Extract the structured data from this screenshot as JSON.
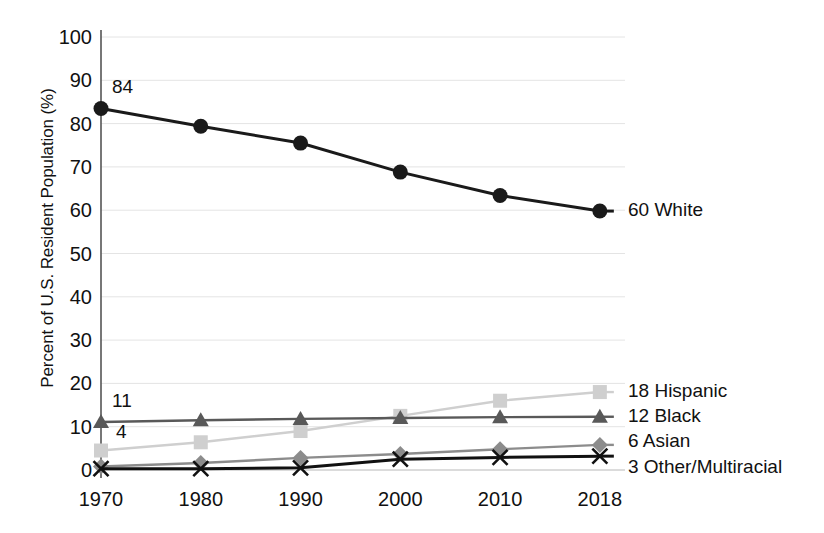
{
  "chart_data": {
    "type": "line",
    "title": "",
    "xlabel": "",
    "ylabel": "Percent of U.S. Resident Population (%)",
    "categories": [
      "1970",
      "1980",
      "1990",
      "2000",
      "2010",
      "2018"
    ],
    "ylim": [
      0,
      100
    ],
    "ytick_labels": [
      "0",
      "10",
      "20",
      "30",
      "40",
      "50",
      "60",
      "70",
      "80",
      "90",
      "100"
    ],
    "ytick_values": [
      0,
      10,
      20,
      30,
      40,
      50,
      60,
      70,
      80,
      90,
      100
    ],
    "grid": true,
    "legend_position": "right-of-last-point",
    "series": [
      {
        "name": "White",
        "end_label": "60 White",
        "start_label": "84",
        "marker": "circle",
        "color": "#1a1a1a",
        "values": [
          83.5,
          79.4,
          75.5,
          68.8,
          63.4,
          59.8
        ]
      },
      {
        "name": "Hispanic",
        "end_label": "18 Hispanic",
        "start_label": "4",
        "marker": "square",
        "color": "#cfcfcf",
        "values": [
          4.5,
          6.4,
          9.0,
          12.5,
          16.0,
          18.0
        ]
      },
      {
        "name": "Black",
        "end_label": "12 Black",
        "start_label": "11",
        "marker": "triangle",
        "color": "#595959",
        "values": [
          11.1,
          11.5,
          11.8,
          12.0,
          12.2,
          12.3
        ]
      },
      {
        "name": "Asian",
        "end_label": "6 Asian",
        "start_label": "",
        "marker": "diamond",
        "color": "#8c8c8c",
        "values": [
          0.8,
          1.6,
          2.8,
          3.7,
          4.8,
          5.8
        ]
      },
      {
        "name": "Other/Multiracial",
        "end_label": "3 Other/Multiracial",
        "start_label": "",
        "marker": "cross",
        "color": "#111111",
        "values": [
          0.3,
          0.3,
          0.5,
          2.5,
          2.9,
          3.2
        ]
      }
    ]
  },
  "axis": {
    "y_title": "Percent of U.S. Resident Population (%)",
    "y_labels": [
      "100",
      "90",
      "80",
      "70",
      "60",
      "50",
      "40",
      "30",
      "20",
      "10",
      "0"
    ],
    "x_labels": [
      "1970",
      "1980",
      "1990",
      "2000",
      "2010",
      "2018"
    ]
  },
  "labels": {
    "white_start": "84",
    "white_end": "60 White",
    "hispanic_start": "4",
    "hispanic_end": "18 Hispanic",
    "black_start": "11",
    "black_end": "12 Black",
    "asian_end": "6 Asian",
    "other_end": "3 Other/Multiracial"
  }
}
